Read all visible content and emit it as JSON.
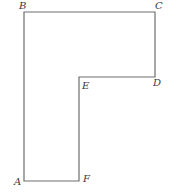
{
  "diagram": {
    "type": "L-shaped polygon",
    "vertices": [
      {
        "label": "A",
        "x": 24,
        "y": 181,
        "label_x": 14,
        "label_y": 185
      },
      {
        "label": "B",
        "x": 24,
        "y": 12,
        "label_x": 19,
        "label_y": 9
      },
      {
        "label": "C",
        "x": 155,
        "y": 12,
        "label_x": 155,
        "label_y": 9
      },
      {
        "label": "D",
        "x": 155,
        "y": 77,
        "label_x": 153,
        "label_y": 86
      },
      {
        "label": "E",
        "x": 79,
        "y": 77,
        "label_x": 82,
        "label_y": 89
      },
      {
        "label": "F",
        "x": 79,
        "y": 181,
        "label_x": 83,
        "label_y": 182
      }
    ],
    "edge_color": "#6e6e6e",
    "label_color": "#3a3a3a"
  }
}
